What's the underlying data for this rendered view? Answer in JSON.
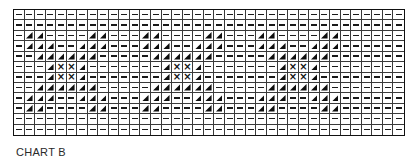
{
  "chart": {
    "caption": "CHART B",
    "columns": 37,
    "rows_count": 12,
    "legend_symbols": {
      "-": "dash",
      "T": "filled-triangle",
      "X": "cross"
    },
    "cross_glyph": "×",
    "rows": [
      "-------------------------------------",
      "-------------------------------------",
      "-TT----TT---TT----TT---TT----TT------",
      "-TTT--TTT---TTT--TTT---TTT--TTT------",
      "--TTTTTT-----TTTTTT-----TTTTTT-------",
      "---TXXT-------TXXT-------TXXT--------",
      "---TXXT-------TXXT-------TXXT--------",
      "--TTTTTT-----TTTTTT-----TTTTTT-------",
      "-TTT--TTT---TTT--TTT---TTT--TTT------",
      "-TT----TT---TT----TT---TT----TT------",
      "-------------------------------------",
      "-------------------------------------"
    ]
  }
}
